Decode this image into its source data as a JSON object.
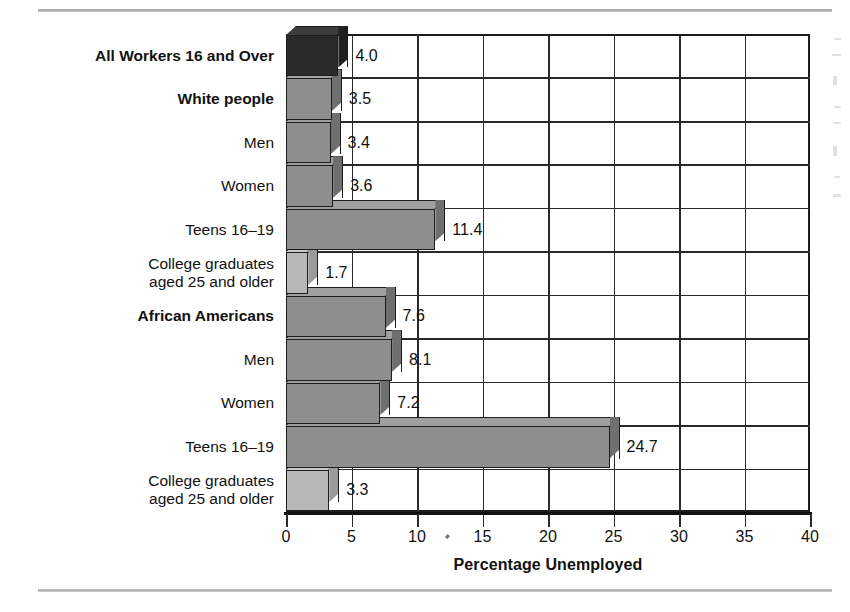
{
  "chart_data": {
    "type": "bar",
    "orientation": "horizontal",
    "title": "",
    "xlabel": "Percentage Unemployed",
    "ylabel": "",
    "xlim": [
      0,
      40
    ],
    "xticks": [
      "0",
      "5",
      "10",
      "15",
      "20",
      "25",
      "30",
      "35",
      "40"
    ],
    "grid": true,
    "legend": "none",
    "categories": [
      "All Workers 16 and Over",
      "White people",
      "Men",
      "Women",
      "Teens 16–19",
      "College graduates aged 25 and older",
      "African Americans",
      "Men",
      "Women",
      "Teens 16–19",
      "College graduates aged 25 and older"
    ],
    "values": [
      4.0,
      3.5,
      3.4,
      3.6,
      11.4,
      1.7,
      7.6,
      8.1,
      7.2,
      24.7,
      3.3
    ],
    "bars": [
      {
        "label": "All Workers 16 and Over",
        "label_lines": [
          "All Workers 16 and Over"
        ],
        "value": 4.0,
        "value_text": "4.0",
        "emphasis": "bold",
        "shade": "black"
      },
      {
        "label": "White people",
        "label_lines": [
          "White people"
        ],
        "value": 3.5,
        "value_text": "3.5",
        "emphasis": "bold",
        "shade": "medium"
      },
      {
        "label": "Men",
        "label_lines": [
          "Men"
        ],
        "value": 3.4,
        "value_text": "3.4",
        "emphasis": "normal",
        "shade": "medium"
      },
      {
        "label": "Women",
        "label_lines": [
          "Women"
        ],
        "value": 3.6,
        "value_text": "3.6",
        "emphasis": "normal",
        "shade": "medium"
      },
      {
        "label": "Teens 16–19",
        "label_lines": [
          "Teens 16–19"
        ],
        "value": 11.4,
        "value_text": "11.4",
        "emphasis": "normal",
        "shade": "medium"
      },
      {
        "label": "College graduates aged 25 and older",
        "label_lines": [
          "College graduates",
          "aged 25 and older"
        ],
        "value": 1.7,
        "value_text": "1.7",
        "emphasis": "normal",
        "shade": "light"
      },
      {
        "label": "African Americans",
        "label_lines": [
          "African Americans"
        ],
        "value": 7.6,
        "value_text": "7.6",
        "emphasis": "bold",
        "shade": "medium"
      },
      {
        "label": "Men",
        "label_lines": [
          "Men"
        ],
        "value": 8.1,
        "value_text": "8.1",
        "emphasis": "normal",
        "shade": "medium"
      },
      {
        "label": "Women",
        "label_lines": [
          "Women"
        ],
        "value": 7.2,
        "value_text": "7.2",
        "emphasis": "normal",
        "shade": "medium"
      },
      {
        "label": "Teens 16–19",
        "label_lines": [
          "Teens 16–19"
        ],
        "value": 24.7,
        "value_text": "24.7",
        "emphasis": "normal",
        "shade": "medium"
      },
      {
        "label": "College graduates aged 25 and older",
        "label_lines": [
          "College graduates",
          "aged 25 and older"
        ],
        "value": 3.3,
        "value_text": "3.3",
        "emphasis": "normal",
        "shade": "light"
      }
    ]
  },
  "colors": {
    "black_face": "#2b2b2b",
    "black_top": "#3c3c3c",
    "black_side": "#202020",
    "medium_face": "#8e8e8e",
    "medium_top": "#a0a0a0",
    "medium_side": "#6f6f6f",
    "light_face": "#b8b8b8",
    "light_top": "#c8c8c8",
    "light_side": "#9a9a9a",
    "axis": "#111111",
    "grid": "#2a2a2a",
    "rule": "#b4b4b4"
  }
}
